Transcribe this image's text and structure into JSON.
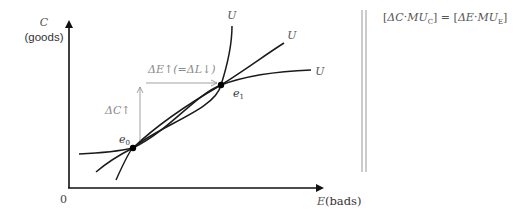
{
  "diagram": {
    "type": "indifference-curve-diagram",
    "axes": {
      "y_label_var": "C",
      "y_label_desc": "(goods)",
      "x_label_var": "E",
      "x_label_desc": "(bads)",
      "origin_label": "0"
    },
    "curves": [
      {
        "name": "steep-curve",
        "label": "U"
      },
      {
        "name": "middle-curve",
        "label": "U"
      },
      {
        "name": "flat-curve",
        "label": "U"
      }
    ],
    "points": [
      {
        "name": "e0",
        "label_var": "e",
        "label_sub": "0"
      },
      {
        "name": "e1",
        "label_var": "e",
        "label_sub": "1"
      }
    ],
    "annotations": {
      "delta_c": "ΔC↑",
      "delta_e": "ΔE↑(=ΔL↓)"
    },
    "equation": {
      "lhs_open": "[",
      "lhs_delta": "ΔC",
      "dot1": "·",
      "lhs_mu": "MU",
      "lhs_sub": "C",
      "lhs_close": "]",
      "equals": " = ",
      "rhs_open": "[",
      "rhs_delta": "ΔE",
      "dot2": "·",
      "rhs_mu": "MU",
      "rhs_sub": "E",
      "rhs_close": "]"
    },
    "colors": {
      "curve": "#1a1a1a",
      "annotation": "#8a8a8a",
      "divider": "#999999",
      "text": "#444444"
    }
  }
}
